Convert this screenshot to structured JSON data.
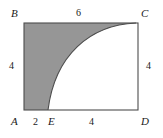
{
  "figure": {
    "background_color": "#ffffff",
    "stroke_color": "#4d4d4d",
    "shade_color": "#969696",
    "text_color": "#1a1a1a",
    "vertices": {
      "B": "B",
      "C": "C",
      "A": "A",
      "D": "D",
      "E": "E"
    },
    "measures": {
      "top": "6",
      "left": "4",
      "right": "4",
      "bottom_segment_AE": "2",
      "bottom_segment_ED": "4"
    },
    "geometry": {
      "rect_left": 24,
      "rect_top": 23,
      "rect_right": 138,
      "rect_bottom": 110,
      "curve_start_x": 48,
      "curve_start_y": 110,
      "curve_end_x": 136,
      "curve_end_y": 23
    }
  }
}
